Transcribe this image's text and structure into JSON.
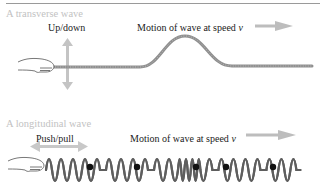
{
  "transverse": {
    "title": "A transverse wave",
    "motion_label": "Up/down",
    "speed_label_prefix": "Motion of wave at speed ",
    "speed_symbol": "v"
  },
  "longitudinal": {
    "title": "A longitudinal wave",
    "motion_label": "Push/pull",
    "speed_label_prefix": "Motion of wave at speed ",
    "speed_symbol": "v"
  },
  "colors": {
    "arrow": "#bdbdbd",
    "rope": "#8c8c8c",
    "spring": "#6e6e6e",
    "marker": "#111111",
    "title": "#c2c2c2"
  }
}
